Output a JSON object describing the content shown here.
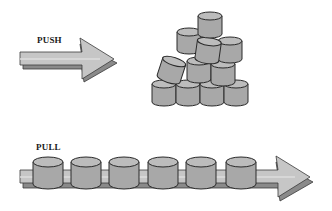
{
  "diagram": {
    "push": {
      "label": "PUSH",
      "description": "Arrow pushing into a disordered pile of cans",
      "can_count": 12
    },
    "pull": {
      "label": "PULL",
      "description": "Cans evenly spaced along an arrow",
      "can_count": 6
    },
    "colors": {
      "background": "#ffffff",
      "arrow_light": "#c4c4c4",
      "arrow_dark": "#8a8a8a",
      "can_body": "#a9a9a9",
      "can_top": "#b8b8b8",
      "outline": "#2a2a2a",
      "text": "#1a1a1a"
    }
  }
}
